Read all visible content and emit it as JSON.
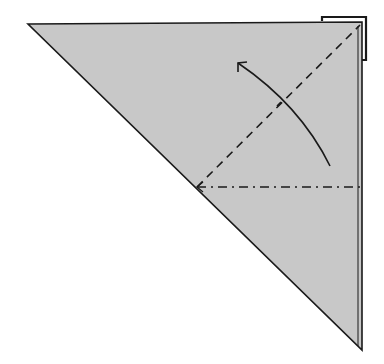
{
  "diagram": {
    "type": "origami-fold-step",
    "paper_color": "#c8c8c8",
    "line_color": "#1a1a1a",
    "background": "#ffffff",
    "shapes": {
      "triangle": {
        "points": "28,24 362,22 362,350"
      },
      "corner_flap": {
        "points": "322,16 366,16 366,58"
      },
      "valley_fold_line": {
        "x1": 197,
        "y1": 187,
        "x2": 360,
        "y2": 24,
        "style": "dashed"
      },
      "mountain_fold_line": {
        "x1": 197,
        "y1": 187,
        "x2": 360,
        "y2": 187,
        "style": "dash-dot"
      },
      "fold_arrow": {
        "path": "M 330 166 Q 300 105 238 63",
        "direction": "up-left"
      }
    }
  }
}
